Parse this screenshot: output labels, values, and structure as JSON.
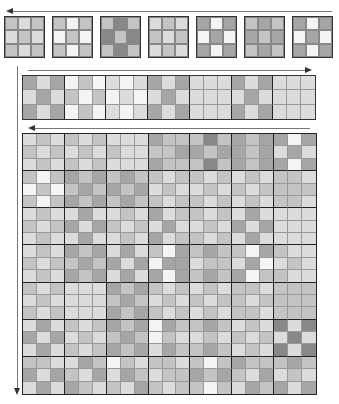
{
  "palette": [
    "#f4f4f4",
    "#dcdcdc",
    "#c4c4c4",
    "#a6a6a6",
    "#888888"
  ],
  "arrows": {
    "top": {
      "direction": "left"
    },
    "strip": {
      "direction": "right"
    },
    "big": {
      "direction": "left"
    },
    "side": {
      "direction": "down"
    }
  },
  "top_tiles": [
    [
      [
        2,
        1,
        2
      ],
      [
        1,
        2,
        1
      ],
      [
        2,
        1,
        2
      ]
    ],
    [
      [
        2,
        0,
        2
      ],
      [
        0,
        2,
        0
      ],
      [
        2,
        0,
        2
      ]
    ],
    [
      [
        2,
        4,
        2
      ],
      [
        4,
        2,
        4
      ],
      [
        2,
        4,
        2
      ]
    ],
    [
      [
        1,
        2,
        1
      ],
      [
        2,
        1,
        2
      ],
      [
        1,
        2,
        1
      ]
    ],
    [
      [
        3,
        0,
        3
      ],
      [
        0,
        3,
        0
      ],
      [
        3,
        0,
        3
      ]
    ],
    [
      [
        2,
        3,
        2
      ],
      [
        3,
        2,
        3
      ],
      [
        2,
        3,
        2
      ]
    ],
    [
      [
        3,
        0,
        3
      ],
      [
        0,
        3,
        0
      ],
      [
        3,
        0,
        3
      ]
    ]
  ],
  "strip": [
    [
      3,
      1,
      3,
      0,
      2,
      0,
      1,
      0,
      1,
      3,
      1,
      3,
      1,
      1,
      1,
      3,
      1,
      3,
      1,
      1,
      1
    ],
    [
      1,
      3,
      1,
      2,
      0,
      2,
      0,
      1,
      0,
      1,
      3,
      1,
      1,
      1,
      1,
      1,
      3,
      1,
      1,
      1,
      1
    ],
    [
      3,
      1,
      3,
      0,
      2,
      0,
      1,
      0,
      1,
      3,
      1,
      3,
      1,
      1,
      1,
      3,
      1,
      3,
      1,
      1,
      1
    ]
  ],
  "big": [
    [
      1,
      2,
      1,
      2,
      1,
      2,
      1,
      1,
      1,
      3,
      2,
      2,
      2,
      4,
      2,
      3,
      2,
      3,
      3,
      0,
      3
    ],
    [
      2,
      1,
      2,
      1,
      2,
      1,
      2,
      1,
      1,
      2,
      2,
      3,
      3,
      2,
      3,
      3,
      2,
      3,
      1,
      3,
      1
    ],
    [
      1,
      2,
      1,
      2,
      1,
      2,
      1,
      1,
      1,
      3,
      2,
      2,
      2,
      4,
      2,
      3,
      2,
      3,
      3,
      0,
      3
    ],
    [
      2,
      0,
      2,
      3,
      2,
      3,
      2,
      3,
      2,
      2,
      1,
      2,
      2,
      1,
      2,
      1,
      2,
      1,
      2,
      2,
      1
    ],
    [
      0,
      2,
      0,
      2,
      3,
      2,
      3,
      2,
      3,
      1,
      2,
      1,
      1,
      2,
      1,
      2,
      1,
      2,
      2,
      2,
      2
    ],
    [
      2,
      0,
      2,
      3,
      2,
      3,
      2,
      3,
      2,
      2,
      1,
      2,
      2,
      1,
      2,
      1,
      2,
      1,
      2,
      2,
      1
    ],
    [
      1,
      2,
      1,
      1,
      3,
      1,
      1,
      2,
      1,
      3,
      1,
      2,
      2,
      1,
      2,
      1,
      3,
      1,
      1,
      1,
      1
    ],
    [
      2,
      1,
      2,
      3,
      1,
      3,
      2,
      1,
      2,
      1,
      3,
      1,
      1,
      2,
      1,
      3,
      1,
      3,
      1,
      1,
      1
    ],
    [
      1,
      2,
      1,
      1,
      3,
      1,
      1,
      2,
      1,
      3,
      1,
      2,
      2,
      1,
      2,
      1,
      3,
      1,
      1,
      1,
      1
    ],
    [
      1,
      2,
      1,
      3,
      2,
      3,
      1,
      3,
      1,
      2,
      0,
      3,
      2,
      3,
      2,
      2,
      0,
      3,
      2,
      1,
      1
    ],
    [
      2,
      1,
      2,
      2,
      3,
      2,
      3,
      1,
      3,
      0,
      3,
      3,
      1,
      2,
      2,
      1,
      3,
      0,
      1,
      2,
      1
    ],
    [
      1,
      2,
      1,
      3,
      2,
      3,
      1,
      3,
      1,
      3,
      0,
      3,
      2,
      3,
      2,
      3,
      0,
      2,
      2,
      1,
      1
    ],
    [
      2,
      1,
      2,
      1,
      1,
      1,
      3,
      2,
      3,
      2,
      1,
      2,
      1,
      2,
      1,
      2,
      2,
      1,
      2,
      2,
      2
    ],
    [
      1,
      2,
      1,
      1,
      1,
      1,
      2,
      3,
      2,
      1,
      2,
      1,
      2,
      1,
      2,
      2,
      1,
      2,
      2,
      2,
      2
    ],
    [
      2,
      1,
      2,
      1,
      1,
      1,
      3,
      2,
      3,
      2,
      1,
      2,
      1,
      2,
      1,
      2,
      2,
      1,
      2,
      2,
      2
    ],
    [
      1,
      3,
      1,
      2,
      1,
      2,
      3,
      2,
      3,
      0,
      3,
      2,
      2,
      3,
      2,
      1,
      2,
      1,
      4,
      1,
      4
    ],
    [
      3,
      1,
      3,
      1,
      2,
      1,
      2,
      3,
      2,
      0,
      2,
      1,
      1,
      2,
      1,
      2,
      1,
      2,
      1,
      4,
      1
    ],
    [
      1,
      3,
      1,
      2,
      1,
      2,
      3,
      2,
      3,
      1,
      3,
      2,
      2,
      3,
      2,
      1,
      2,
      1,
      4,
      1,
      4
    ],
    [
      2,
      2,
      1,
      1,
      3,
      2,
      0,
      2,
      1,
      2,
      2,
      1,
      2,
      0,
      2,
      3,
      2,
      2,
      2,
      3,
      2
    ],
    [
      3,
      1,
      3,
      2,
      1,
      3,
      1,
      3,
      2,
      1,
      2,
      2,
      3,
      2,
      3,
      2,
      1,
      3,
      1,
      2,
      1
    ],
    [
      1,
      3,
      1,
      3,
      2,
      1,
      2,
      1,
      3,
      2,
      1,
      2,
      2,
      0,
      2,
      1,
      3,
      2,
      3,
      1,
      3
    ]
  ]
}
